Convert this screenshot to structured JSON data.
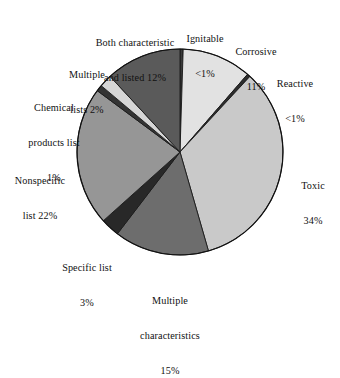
{
  "chart_data": {
    "type": "pie",
    "title": "",
    "subtitle": "",
    "xlabel": "",
    "ylabel": "",
    "legend_position": "labels-around-pie",
    "grid": false,
    "categories": [
      "Ignitable",
      "Corrosive",
      "Reactive",
      "Toxic",
      "Multiple characteristics",
      "Specific list",
      "Nonspecific list",
      "Chemical products list",
      "Multiple lists",
      "Both characteristic and listed"
    ],
    "values": [
      0.5,
      11,
      0.5,
      34,
      15,
      3,
      22,
      1,
      2,
      12
    ],
    "value_labels": [
      "<1%",
      "11%",
      "<1%",
      "34%",
      "15%",
      "3%",
      "22%",
      "1%",
      "2%",
      "12%"
    ],
    "colors": [
      "#3a3a3a",
      "#e2e2e2",
      "#2e2e2e",
      "#c9c9c9",
      "#6d6d6d",
      "#282828",
      "#969696",
      "#343434",
      "#d6d6d6",
      "#5a5a5a"
    ],
    "units": "percent",
    "total": 101
  },
  "geometry": {
    "center_x": 180,
    "center_y": 152,
    "radius": 103,
    "start_angle_deg": 0,
    "direction": "clockwise"
  },
  "labels": [
    {
      "key": "both-characteristic-and-listed",
      "line1": "Both characteristic",
      "line2": "and listed 12%",
      "line3": ""
    },
    {
      "key": "ignitable",
      "line1": "Ignitable",
      "line2": "<1%",
      "line3": ""
    },
    {
      "key": "corrosive",
      "line1": "Corrosive",
      "line2": "11%",
      "line3": ""
    },
    {
      "key": "reactive",
      "line1": "Reactive",
      "line2": "<1%",
      "line3": ""
    },
    {
      "key": "toxic",
      "line1": "Toxic",
      "line2": "34%",
      "line3": ""
    },
    {
      "key": "multiple-lists",
      "line1": "Multiple",
      "line2": "lists 2%",
      "line3": ""
    },
    {
      "key": "chemical-products-list",
      "line1": "Chemical",
      "line2": "products list",
      "line3": "1%"
    },
    {
      "key": "nonspecific-list",
      "line1": "Nonspecific",
      "line2": "list 22%",
      "line3": ""
    },
    {
      "key": "specific-list",
      "line1": "Specific list",
      "line2": "3%",
      "line3": ""
    },
    {
      "key": "multiple-characteristics",
      "line1": "Multiple",
      "line2": "characteristics",
      "line3": "15%"
    }
  ]
}
